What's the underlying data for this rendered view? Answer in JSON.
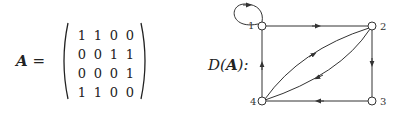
{
  "matrix": {
    "symbol": "A",
    "equals": "=",
    "rows": [
      [
        1,
        1,
        0,
        0
      ],
      [
        0,
        0,
        1,
        1
      ],
      [
        0,
        0,
        0,
        1
      ],
      [
        1,
        1,
        0,
        0
      ]
    ]
  },
  "graph": {
    "label_prefix": "D(",
    "label_symbol": "A",
    "label_suffix": "):",
    "nodes": [
      {
        "id": "1",
        "x": 262,
        "y": 26
      },
      {
        "id": "2",
        "x": 372,
        "y": 26
      },
      {
        "id": "3",
        "x": 372,
        "y": 101
      },
      {
        "id": "4",
        "x": 262,
        "y": 101
      }
    ],
    "edges": [
      {
        "from": "1",
        "to": "1",
        "type": "self-loop"
      },
      {
        "from": "1",
        "to": "2",
        "type": "straight"
      },
      {
        "from": "2",
        "to": "3",
        "type": "straight"
      },
      {
        "from": "3",
        "to": "4",
        "type": "straight"
      },
      {
        "from": "4",
        "to": "1",
        "type": "straight"
      },
      {
        "from": "4",
        "to": "2",
        "type": "curved"
      },
      {
        "from": "2",
        "to": "4",
        "type": "curved"
      }
    ]
  }
}
